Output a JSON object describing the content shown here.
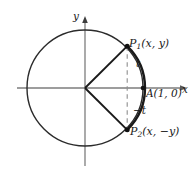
{
  "figure": {
    "kind": "unit-circle-diagram",
    "title": "",
    "background_color": "#ffffff",
    "axis_color": "#7a7a7a",
    "curve_color": "#1a1a1a",
    "dash_color": "#8c8c8c",
    "text_color": "#1a1a1a"
  },
  "axes": {
    "x_label": "x",
    "y_label": "y",
    "x_start_px": 17,
    "x_end_px": 187,
    "y_start_px": 16,
    "y_end_px": 166
  },
  "circle": {
    "center_px": [
      85,
      88
    ],
    "radius_px": 58,
    "label": ""
  },
  "points": [
    {
      "id": "P1",
      "label": "P",
      "sub": "1",
      "coords": "(x, y)",
      "full": "P1(x, y)",
      "px": [
        127,
        46
      ]
    },
    {
      "id": "P2",
      "label": "P",
      "sub": "2",
      "coords": "(x, −y)",
      "full": "P2(x, −y)",
      "px": [
        128,
        129
      ]
    },
    {
      "id": "A",
      "label": "A",
      "sub": "",
      "coords": "(1, 0)",
      "full": "A(1, 0)",
      "px": [
        143,
        88
      ]
    }
  ],
  "arc_labels": [
    {
      "id": "t",
      "text": "t",
      "px": [
        138,
        64
      ]
    },
    {
      "id": "-t",
      "text": "−t",
      "px": [
        136,
        112
      ]
    }
  ],
  "segments": [
    {
      "id": "radius-to-p1",
      "from": "origin",
      "to": "P1",
      "style": "solid"
    },
    {
      "id": "radius-to-p2",
      "from": "origin",
      "to": "P2",
      "style": "solid"
    },
    {
      "id": "chord-p1-p2",
      "from": "P1",
      "to": "P2",
      "style": "dashed"
    }
  ]
}
